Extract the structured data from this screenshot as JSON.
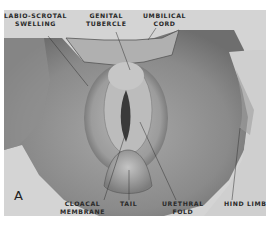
{
  "figure": {
    "panel_letter": "A",
    "labels": {
      "labio_scrotal": [
        "LABIO-SCROTAL",
        "SWELLING"
      ],
      "genital_tubercle": [
        "GENITAL",
        "TUBERCLE"
      ],
      "umbilical_cord": [
        "UMBILICAL",
        "CORD"
      ],
      "cloacal_membrane": [
        "CLOACAL",
        "MEMBRANE"
      ],
      "tail": "TAIL",
      "urethral_fold": [
        "URETHRAL",
        "FOLD"
      ],
      "hind_limb": "HIND LIMB"
    },
    "colors": {
      "background": "#d4d4d4",
      "tissue_dark": "#6a6a6a",
      "tissue_mid": "#9a9a9a",
      "tissue_light": "#bdbdbd",
      "label_text": "#2a2a2a"
    }
  }
}
